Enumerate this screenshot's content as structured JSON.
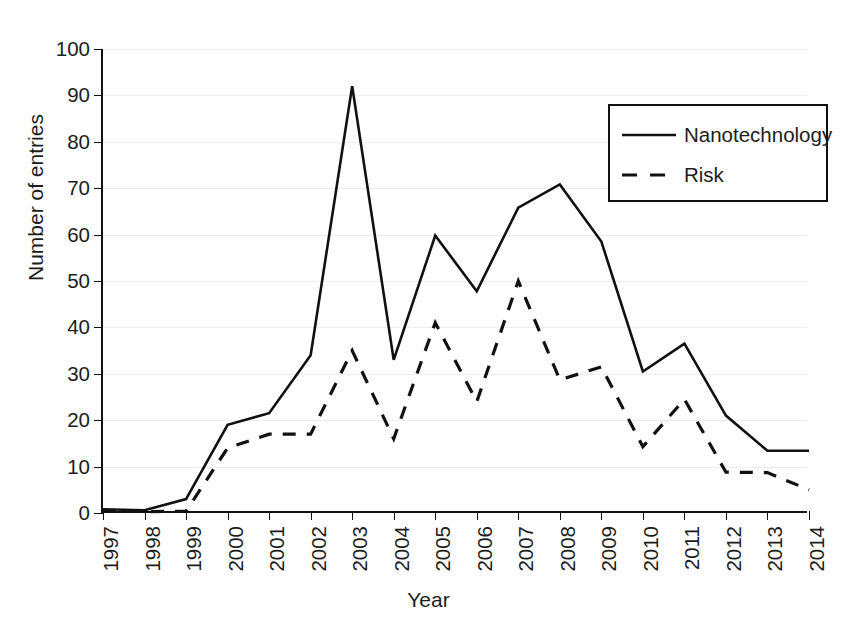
{
  "chart_data": {
    "type": "line",
    "title": "",
    "subtitle": "",
    "xlabel": "Year",
    "ylabel": "Number of entries",
    "categories": [
      "1997",
      "1998",
      "1999",
      "2000",
      "2001",
      "2002",
      "2003",
      "2004",
      "2005",
      "2006",
      "2007",
      "2008",
      "2009",
      "2010",
      "2011",
      "2012",
      "2013",
      "2014"
    ],
    "x": [
      1997,
      1998,
      1999,
      2000,
      2001,
      2002,
      2003,
      2004,
      2005,
      2006,
      2007,
      2008,
      2009,
      2010,
      2011,
      2012,
      2013,
      2014
    ],
    "series": [
      {
        "name": "Nanotechnology",
        "style": "solid",
        "color": "#111111",
        "values": [
          0.8,
          0.6,
          3.0,
          19.0,
          21.5,
          34.0,
          92.0,
          33.0,
          59.8,
          47.8,
          65.8,
          70.8,
          58.5,
          30.5,
          36.5,
          21.0,
          13.4,
          13.4
        ]
      },
      {
        "name": "Risk",
        "style": "dashed",
        "color": "#111111",
        "values": [
          0.5,
          0.3,
          0.4,
          14.0,
          17.0,
          17.0,
          35.0,
          16.0,
          41.0,
          24.0,
          50.0,
          28.7,
          31.5,
          14.3,
          24.5,
          8.8,
          8.7,
          5.0
        ]
      }
    ],
    "ylim": [
      0,
      100
    ],
    "yticks": [
      0,
      10,
      20,
      30,
      40,
      50,
      60,
      70,
      80,
      90,
      100
    ],
    "ytick_labels": [
      "0",
      "10",
      "20",
      "30",
      "40",
      "50",
      "60",
      "70",
      "80",
      "90",
      "100"
    ],
    "xlim": [
      1997,
      2014
    ],
    "grid": "horizontal",
    "grid_color": "#eceff1",
    "legend_position": "top-right",
    "xtick_rotation": 90,
    "background": "#ffffff",
    "axis_color": "#111111"
  },
  "legend": {
    "entries": [
      {
        "label": "Nanotechnology"
      },
      {
        "label": "Risk"
      }
    ]
  }
}
